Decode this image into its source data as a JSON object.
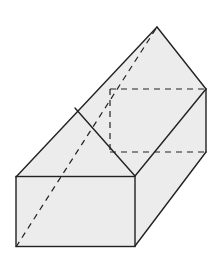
{
  "figure": {
    "colors": {
      "face_fill": "#ececec",
      "edge": "#222222",
      "background": "#ffffff"
    },
    "vertices": {
      "apex": [
        157,
        27
      ],
      "right_top": [
        206,
        89
      ],
      "hidden_back_top": [
        110,
        89
      ],
      "ridge_mid": [
        75,
        108
      ],
      "front_top_left": [
        16,
        177
      ],
      "front_top_right": [
        135,
        176
      ],
      "front_bottom_left": [
        16,
        247
      ],
      "front_bottom_right": [
        135,
        246
      ],
      "right_bottom": [
        206,
        152
      ],
      "hidden_back_bottom": [
        113,
        152
      ]
    }
  }
}
